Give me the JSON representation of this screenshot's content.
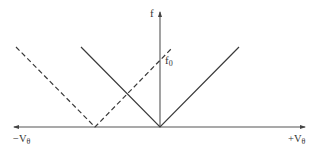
{
  "diagram": {
    "axes": {
      "x_left_label": "−V",
      "x_left_sub": "θ",
      "x_right_label": "+V",
      "x_right_sub": "θ",
      "y_label": "f"
    },
    "annotations": {
      "f0_main": "f",
      "f0_sub": "0"
    },
    "colors": {
      "line": "#3a3a3a",
      "axis": "#444444",
      "text": "#333333"
    },
    "curves": [
      {
        "name": "solid-v",
        "style": "solid",
        "vertex": [
          160,
          127
        ],
        "left_end": [
          81,
          47
        ],
        "right_end": [
          239,
          47
        ]
      },
      {
        "name": "dashed-v",
        "style": "dashed",
        "vertex": [
          95,
          127
        ],
        "left_end": [
          16,
          47
        ],
        "right_end": [
          172,
          48
        ]
      }
    ]
  }
}
